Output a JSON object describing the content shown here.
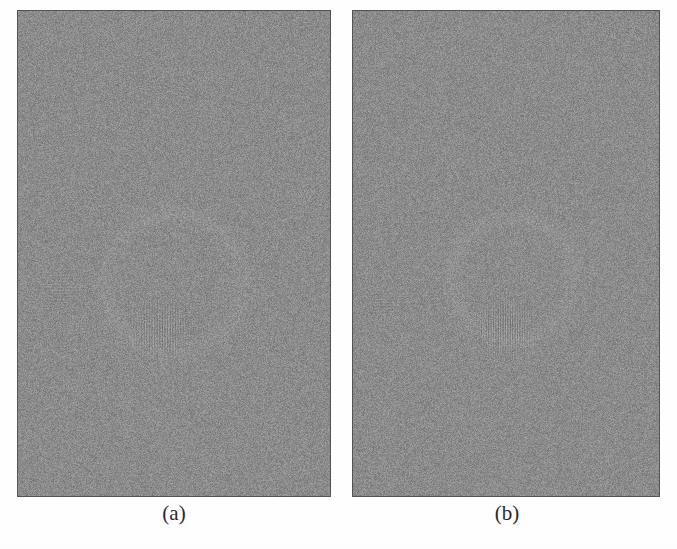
{
  "figure": {
    "kind": "two-panel-grayscale-noise-figure",
    "page_background": "#fefefe",
    "panel_count": 2
  },
  "panels": [
    {
      "id": "panel-a",
      "caption": "(a)",
      "rect": {
        "x": 17,
        "y": 10,
        "width": 314,
        "height": 487
      },
      "caption_center_x": 174,
      "caption_y": 503,
      "base_gray": "#8b8b8b",
      "border_color": "#5e5e5e",
      "noise_amplitude": 26,
      "seed": 13579,
      "features": [
        {
          "name": "vertical-chirp-patch",
          "type": "vertical-stripes",
          "center_x_frac": 0.46,
          "center_y_frac": 0.66,
          "width_frac": 0.34,
          "height_frac": 0.17,
          "period_px": 2.6,
          "amplitude": 17
        },
        {
          "name": "horizontal-band-left",
          "type": "horizontal-stripes",
          "center_x_frac": 0.13,
          "center_y_frac": 0.57,
          "width_frac": 0.28,
          "height_frac": 0.1,
          "period_px": 3.0,
          "amplitude": 8
        },
        {
          "name": "faint-ring-upper",
          "type": "ring",
          "center_x_frac": 0.5,
          "center_y_frac": 0.56,
          "radius_frac": 0.22,
          "amplitude": 5
        }
      ]
    },
    {
      "id": "panel-b",
      "caption": "(b)",
      "rect": {
        "x": 352,
        "y": 10,
        "width": 308,
        "height": 487
      },
      "caption_center_x": 507,
      "caption_y": 503,
      "base_gray": "#8b8b8b",
      "border_color": "#5e5e5e",
      "noise_amplitude": 26,
      "seed": 24680,
      "features": [
        {
          "name": "vertical-chirp-patch",
          "type": "vertical-stripes",
          "center_x_frac": 0.49,
          "center_y_frac": 0.65,
          "width_frac": 0.3,
          "height_frac": 0.19,
          "period_px": 2.4,
          "amplitude": 20
        },
        {
          "name": "horizontal-band-left",
          "type": "horizontal-stripes",
          "center_x_frac": 0.12,
          "center_y_frac": 0.6,
          "width_frac": 0.24,
          "height_frac": 0.09,
          "period_px": 3.0,
          "amplitude": 7
        },
        {
          "name": "faint-ring-upper",
          "type": "ring",
          "center_x_frac": 0.52,
          "center_y_frac": 0.55,
          "radius_frac": 0.2,
          "amplitude": 5
        }
      ]
    }
  ],
  "layout": {
    "gap_between_panels_px": 21,
    "caption_font_size_px": 21,
    "caption_color": "#2a2a2a"
  }
}
